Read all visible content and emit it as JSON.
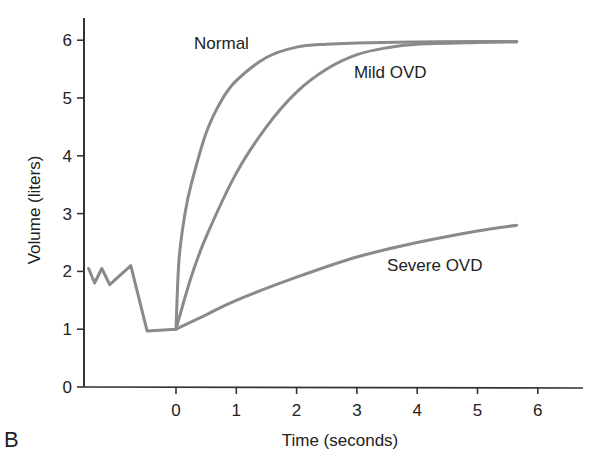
{
  "panel_label": "B",
  "chart_data": {
    "type": "line",
    "title": "",
    "xlabel": "Time (seconds)",
    "ylabel": "Volume (liters)",
    "xlim": [
      -1.5,
      6.8
    ],
    "ylim": [
      0,
      6.3
    ],
    "xticks": [
      0,
      1,
      2,
      3,
      4,
      5,
      6
    ],
    "yticks": [
      0,
      1,
      2,
      3,
      4,
      5,
      6
    ],
    "grid": false,
    "legend": "none (inline annotations)",
    "line_color": "#8a8a8a",
    "series": [
      {
        "name": "Tidal breathing / preparation",
        "x": [
          -1.45,
          -1.35,
          -1.23,
          -1.1,
          -0.75,
          -0.48,
          0.0
        ],
        "y": [
          2.05,
          1.8,
          2.05,
          1.77,
          2.1,
          0.97,
          1.0
        ]
      },
      {
        "name": "Normal",
        "x": [
          0,
          0.05,
          0.15,
          0.25,
          0.5,
          0.75,
          1.0,
          1.5,
          2.0,
          2.5,
          3.0,
          4.0,
          5.0,
          5.65
        ],
        "y": [
          1.0,
          2.2,
          3.0,
          3.5,
          4.4,
          4.95,
          5.3,
          5.7,
          5.88,
          5.93,
          5.95,
          5.97,
          5.98,
          5.98
        ]
      },
      {
        "name": "Mild OVD",
        "x": [
          0,
          0.25,
          0.5,
          1.0,
          1.5,
          2.0,
          2.5,
          3.0,
          3.5,
          4.0,
          5.0,
          5.65
        ],
        "y": [
          1.0,
          1.9,
          2.6,
          3.7,
          4.5,
          5.1,
          5.5,
          5.75,
          5.87,
          5.93,
          5.96,
          5.97
        ]
      },
      {
        "name": "Severe OVD",
        "x": [
          0,
          0.5,
          1.0,
          2.0,
          3.0,
          4.0,
          5.0,
          5.65
        ],
        "y": [
          1.0,
          1.25,
          1.5,
          1.9,
          2.25,
          2.5,
          2.7,
          2.8
        ]
      }
    ],
    "annotations": [
      {
        "text": "Normal",
        "x": 0.3,
        "y": 5.85
      },
      {
        "text": "Mild OVD",
        "x": 2.95,
        "y": 5.35
      },
      {
        "text": "Severe OVD",
        "x": 3.5,
        "y": 2.0
      }
    ]
  }
}
